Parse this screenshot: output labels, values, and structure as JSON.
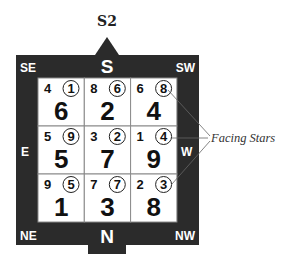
{
  "title": "S2",
  "directions": {
    "top": "S",
    "bottom": "N",
    "left": "E",
    "right": "W",
    "top_left": "SE",
    "top_right": "SW",
    "bottom_left": "NE",
    "bottom_right": "NW"
  },
  "grid": [
    [
      {
        "mountain": "4",
        "facing": "1",
        "base": "6"
      },
      {
        "mountain": "8",
        "facing": "6",
        "base": "2"
      },
      {
        "mountain": "6",
        "facing": "8",
        "base": "4"
      }
    ],
    [
      {
        "mountain": "5",
        "facing": "9",
        "base": "5"
      },
      {
        "mountain": "3",
        "facing": "2",
        "base": "7"
      },
      {
        "mountain": "1",
        "facing": "4",
        "base": "9"
      }
    ],
    [
      {
        "mountain": "9",
        "facing": "5",
        "base": "1"
      },
      {
        "mountain": "7",
        "facing": "7",
        "base": "3"
      },
      {
        "mountain": "2",
        "facing": "3",
        "base": "8"
      }
    ]
  ],
  "annotation": {
    "label": "Facing Stars",
    "points_to": [
      "facing star top-right",
      "facing star middle-right",
      "facing star bottom-right"
    ]
  },
  "colors": {
    "frame": "#2b2b2b",
    "cell_bg": "#ffffff",
    "cell_border": "#8a8a8a",
    "text": "#111111"
  }
}
